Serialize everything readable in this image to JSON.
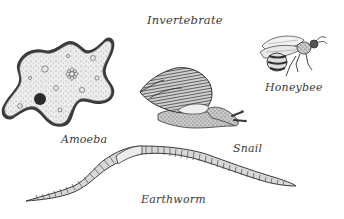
{
  "title": "Invertebrate",
  "organisms": [
    {
      "name": "Amoeba",
      "icon": "amoeba-illustration"
    },
    {
      "name": "Snail",
      "icon": "snail-illustration"
    },
    {
      "name": "Honeybee",
      "icon": "honeybee-illustration"
    },
    {
      "name": "Earthworm",
      "icon": "earthworm-illustration"
    }
  ],
  "colors": {
    "ink": "#3a3a3a",
    "fill_light": "#e6e6e6",
    "fill_mid": "#bdbdbd",
    "nucleus": "#2b2b2b",
    "background": "#ffffff"
  }
}
